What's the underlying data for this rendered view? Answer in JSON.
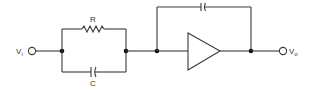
{
  "diagram": {
    "type": "circuit-schematic",
    "colors": {
      "wire": "#3a3a3a",
      "node": "#111111",
      "background": "#ffffff"
    },
    "labels": {
      "input": {
        "main": "V",
        "sub": "i"
      },
      "output": {
        "main": "V",
        "sub": "o"
      },
      "resistor": "R",
      "capacitor": "C"
    },
    "components": [
      {
        "id": "input-terminal",
        "kind": "terminal",
        "label": "Vi"
      },
      {
        "id": "resistor-r",
        "kind": "resistor",
        "label": "R",
        "branch": "top"
      },
      {
        "id": "capacitor-c",
        "kind": "capacitor",
        "label": "C",
        "branch": "bottom"
      },
      {
        "id": "amplifier",
        "kind": "op-amp"
      },
      {
        "id": "feedback-capacitor",
        "kind": "capacitor",
        "label": ""
      },
      {
        "id": "output-terminal",
        "kind": "terminal",
        "label": "Vo"
      }
    ]
  }
}
